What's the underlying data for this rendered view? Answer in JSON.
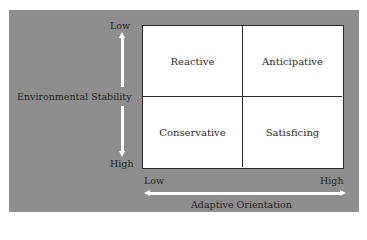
{
  "diagram": {
    "type": "2x2 matrix",
    "y_axis": {
      "title": "Environmental Stability",
      "top_label": "Low",
      "bottom_label": "High"
    },
    "x_axis": {
      "title": "Adaptive Orientation",
      "left_label": "Low",
      "right_label": "High"
    },
    "quadrants": {
      "top_left": "Reactive",
      "top_right": "Anticipative",
      "bottom_left": "Conservative",
      "bottom_right": "Satisficing"
    },
    "colors": {
      "panel_background": "#8e8e8e",
      "grid_background": "#ffffff",
      "grid_lines": "#2a2a2a",
      "arrows": "#ffffff",
      "text": "#1e1e1e"
    }
  }
}
